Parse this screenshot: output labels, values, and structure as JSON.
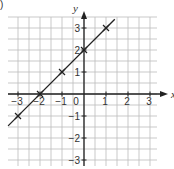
{
  "corner_label": ")",
  "chart_data": {
    "type": "line",
    "title": "",
    "xlabel": "x",
    "ylabel": "y",
    "xlim": [
      -3.45,
      3.3
    ],
    "ylim": [
      -3.3,
      3.5
    ],
    "grid": true,
    "grid_step": 0.5,
    "x_ticks": [
      -3,
      -2,
      -1,
      0,
      1,
      2,
      3
    ],
    "y_ticks": [
      -3,
      -2,
      -1,
      1,
      2,
      3
    ],
    "x_tick_labels": [
      "−3",
      "−2",
      "−1",
      "0",
      "1",
      "2",
      "3"
    ],
    "y_tick_labels": [
      "−3",
      "−2",
      "−1",
      "1",
      "2",
      "3"
    ],
    "series": [
      {
        "name": "y = x + 2",
        "equation": "y = x + 2",
        "line_from": [
          -3.45,
          -1.45
        ],
        "line_to": [
          1.4,
          3.4
        ],
        "points": [
          {
            "x": -3,
            "y": -1
          },
          {
            "x": -2,
            "y": 0
          },
          {
            "x": -1,
            "y": 1
          },
          {
            "x": 0,
            "y": 2
          },
          {
            "x": 1,
            "y": 3
          }
        ],
        "marker": "x",
        "color": "#222222"
      }
    ],
    "colors": {
      "grid": "#bbbbbb",
      "axis": "#222222",
      "line": "#222222"
    }
  }
}
